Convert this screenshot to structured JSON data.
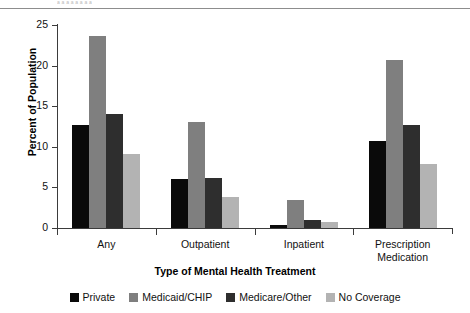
{
  "figure": {
    "caption_fragment": "a a  a a a a a a",
    "ylabel_title": "Percent of Population",
    "xlabel_title": "Type of Mental Health Treatment"
  },
  "chart_data": {
    "type": "bar",
    "title": "",
    "xlabel": "Type of Mental Health Treatment",
    "ylabel": "Percent of Population",
    "ylim": [
      0,
      25
    ],
    "yticks": [
      0,
      5,
      10,
      15,
      20,
      25
    ],
    "ytick_labels": [
      "0",
      "5",
      "10",
      "15",
      "20",
      "25"
    ],
    "grid": false,
    "legend_position": "bottom",
    "categories": [
      "Any",
      "Outpatient",
      "Inpatient",
      "Prescription Medication"
    ],
    "category_labels": [
      [
        "Any"
      ],
      [
        "Outpatient"
      ],
      [
        "Inpatient"
      ],
      [
        "Prescription",
        "Medication"
      ]
    ],
    "series": [
      {
        "name": "Private",
        "color": "#0a0a0a",
        "values": [
          12.7,
          6.0,
          0.4,
          10.7
        ]
      },
      {
        "name": "Medicaid/CHIP",
        "color": "#7f7f7f",
        "values": [
          23.7,
          13.0,
          3.4,
          20.7
        ]
      },
      {
        "name": "Medicare/Other",
        "color": "#2e2e2e",
        "values": [
          14.0,
          6.2,
          1.0,
          12.7
        ]
      },
      {
        "name": "No Coverage",
        "color": "#b3b3b3",
        "values": [
          9.1,
          3.8,
          0.7,
          7.9
        ]
      }
    ]
  }
}
